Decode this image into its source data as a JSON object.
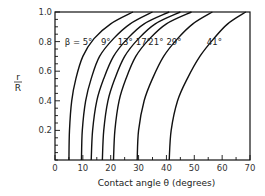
{
  "chart_data": {
    "type": "line",
    "title": "",
    "xlabel": "Contact angle θ (degrees)",
    "ylabel_numerator": "r",
    "ylabel_denominator": "R",
    "xlim": [
      0,
      70
    ],
    "ylim": [
      0,
      1.0
    ],
    "xticks": [
      0,
      10,
      20,
      30,
      40,
      50,
      60,
      70
    ],
    "xtick_labels": [
      "0",
      "10",
      "20",
      "30",
      "40",
      "50",
      "60",
      "70"
    ],
    "xminor_step": 5,
    "yticks": [
      0.2,
      0.4,
      0.6,
      0.8,
      1.0
    ],
    "ytick_labels": [
      "0.2",
      "0.4",
      "0.6",
      "0.8",
      "1.0"
    ],
    "yminor_step": 0.05,
    "grid": false,
    "series": [
      {
        "name": "β = 5°",
        "label": "β = 5°",
        "points": [
          [
            5,
            0
          ],
          [
            5.2,
            0.2
          ],
          [
            6,
            0.4
          ],
          [
            7.5,
            0.55
          ],
          [
            10,
            0.7
          ],
          [
            14,
            0.82
          ],
          [
            20,
            0.92
          ],
          [
            28,
            1.0
          ]
        ]
      },
      {
        "name": "9°",
        "label": "9°",
        "points": [
          [
            9.5,
            0
          ],
          [
            9.8,
            0.2
          ],
          [
            11,
            0.4
          ],
          [
            13,
            0.55
          ],
          [
            16,
            0.7
          ],
          [
            21,
            0.82
          ],
          [
            27,
            0.92
          ],
          [
            35,
            1.0
          ]
        ]
      },
      {
        "name": "13°",
        "label": "13°",
        "points": [
          [
            13,
            0
          ],
          [
            13.5,
            0.2
          ],
          [
            15,
            0.4
          ],
          [
            17.5,
            0.55
          ],
          [
            21,
            0.7
          ],
          [
            26,
            0.82
          ],
          [
            32,
            0.92
          ],
          [
            41,
            1.0
          ]
        ]
      },
      {
        "name": "17°",
        "label": "17°",
        "points": [
          [
            17,
            0
          ],
          [
            17.5,
            0.2
          ],
          [
            19,
            0.4
          ],
          [
            21.5,
            0.55
          ],
          [
            25,
            0.7
          ],
          [
            30,
            0.82
          ],
          [
            36,
            0.92
          ],
          [
            45,
            1.0
          ]
        ]
      },
      {
        "name": "21°",
        "label": "21°",
        "points": [
          [
            21,
            0
          ],
          [
            21.5,
            0.2
          ],
          [
            23,
            0.4
          ],
          [
            25.5,
            0.55
          ],
          [
            29,
            0.7
          ],
          [
            34,
            0.82
          ],
          [
            40,
            0.92
          ],
          [
            49,
            1.0
          ]
        ]
      },
      {
        "name": "29°",
        "label": "29°",
        "points": [
          [
            29.5,
            0
          ],
          [
            30,
            0.2
          ],
          [
            32,
            0.4
          ],
          [
            35,
            0.55
          ],
          [
            39,
            0.7
          ],
          [
            44,
            0.82
          ],
          [
            49.5,
            0.92
          ],
          [
            56.5,
            1.0
          ]
        ]
      },
      {
        "name": "41°",
        "label": "41°",
        "points": [
          [
            41,
            0
          ],
          [
            41.7,
            0.2
          ],
          [
            44,
            0.4
          ],
          [
            47.5,
            0.55
          ],
          [
            52,
            0.7
          ],
          [
            57,
            0.82
          ],
          [
            62,
            0.92
          ],
          [
            68.5,
            1.0
          ]
        ]
      }
    ],
    "annotations": [
      {
        "text": "β = 5°",
        "x": 3.5,
        "y": 0.795
      },
      {
        "text": "9°",
        "x": 16.5,
        "y": 0.795
      },
      {
        "text": "13°",
        "x": 22.5,
        "y": 0.795
      },
      {
        "text": "17°",
        "x": 29.0,
        "y": 0.795
      },
      {
        "text": "21°",
        "x": 33.5,
        "y": 0.795
      },
      {
        "text": "29°",
        "x": 40.0,
        "y": 0.795
      },
      {
        "text": "41°",
        "x": 54.5,
        "y": 0.795
      }
    ]
  }
}
